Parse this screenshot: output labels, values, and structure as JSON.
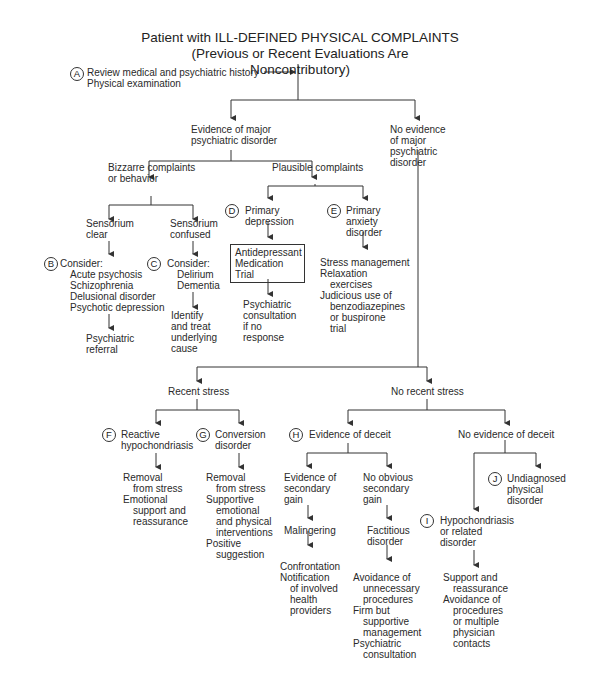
{
  "title": {
    "line1": "Patient with ILL-DEFINED PHYSICAL COMPLAINTS",
    "line2": "(Previous or Recent Evaluations Are Noncontributory)"
  },
  "step_a": {
    "label": "A",
    "lines": [
      "Review medical and psychiatric history",
      "Physical examination"
    ]
  },
  "evidence_major": {
    "lines": [
      "Evidence of major",
      "psychiatric disorder"
    ]
  },
  "no_evidence_major": {
    "lines": [
      "No evidence",
      "of major",
      "psychiatric",
      "disorder"
    ]
  },
  "bizarre": {
    "lines": [
      "Bizzarre complaints",
      "or behavior"
    ]
  },
  "plausible": {
    "lines": [
      "Plausible complaints"
    ]
  },
  "sensorium_clear": {
    "lines": [
      "Sensorium",
      "clear"
    ]
  },
  "sensorium_confused": {
    "lines": [
      "Sensorium",
      "confused"
    ]
  },
  "step_b": {
    "label": "B",
    "header": "Consider:",
    "items": [
      "Acute psychosis",
      "Schizophrenia",
      "Delusional disorder",
      "Psychotic depression"
    ],
    "next": [
      "Psychiatric",
      "referral"
    ]
  },
  "step_c": {
    "label": "C",
    "header": "Consider:",
    "items": [
      "Delirium",
      "Dementia"
    ],
    "next": [
      "Identify",
      "and treat",
      "underlying",
      "cause"
    ]
  },
  "step_d": {
    "label": "D",
    "lines": [
      "Primary",
      "depression"
    ],
    "box": [
      "Antidepressant",
      "Medication",
      "Trial"
    ],
    "next": [
      "Psychiatric",
      "consultation",
      "if no",
      "response"
    ]
  },
  "step_e": {
    "label": "E",
    "lines": [
      "Primary",
      "anxiety",
      "disorder"
    ],
    "next": [
      "Stress management",
      "Relaxation",
      "exercises",
      "Judicious use of",
      "benzodiazepines",
      "or buspirone",
      "trial"
    ]
  },
  "recent_stress": {
    "lines": [
      "Recent stress"
    ]
  },
  "no_recent_stress": {
    "lines": [
      "No recent stress"
    ]
  },
  "step_f": {
    "label": "F",
    "lines": [
      "Reactive",
      "hypochondriasis"
    ],
    "next": [
      "Removal",
      "from stress",
      "Emotional",
      "support and",
      "reassurance"
    ]
  },
  "step_g": {
    "label": "G",
    "lines": [
      "Conversion",
      "disorder"
    ],
    "next": [
      "Removal",
      "from stress",
      "Supportive",
      "emotional",
      "and physical",
      "interventions",
      "Positive",
      "suggestion"
    ]
  },
  "step_h": {
    "label": "H",
    "lines": [
      "Evidence of deceit"
    ]
  },
  "no_deceit": {
    "lines": [
      "No evidence of deceit"
    ]
  },
  "secondary_gain": {
    "lines": [
      "Evidence of",
      "secondary",
      "gain"
    ],
    "result": [
      "Malingering"
    ],
    "next": [
      "Confrontation",
      "Notification",
      "of involved",
      "health",
      "providers"
    ]
  },
  "no_secondary_gain": {
    "lines": [
      "No obvious",
      "secondary",
      "gain"
    ],
    "result": [
      "Factitious",
      "disorder"
    ],
    "next": [
      "Avoidance of",
      "unnecessary",
      "procedures",
      "Firm but",
      "supportive",
      "management",
      "Psychiatric",
      "consultation"
    ]
  },
  "step_i": {
    "label": "I",
    "lines": [
      "Hypochondriasis",
      "or related",
      "disorder"
    ],
    "next": [
      "Support and",
      "reassurance",
      "Avoidance of",
      "procedures",
      "or multiple",
      "physician",
      "contacts"
    ]
  },
  "step_j": {
    "label": "J",
    "lines": [
      "Undiagnosed",
      "physical",
      "disorder"
    ]
  },
  "colors": {
    "ink": "#2a2a2a",
    "background": "#ffffff"
  }
}
